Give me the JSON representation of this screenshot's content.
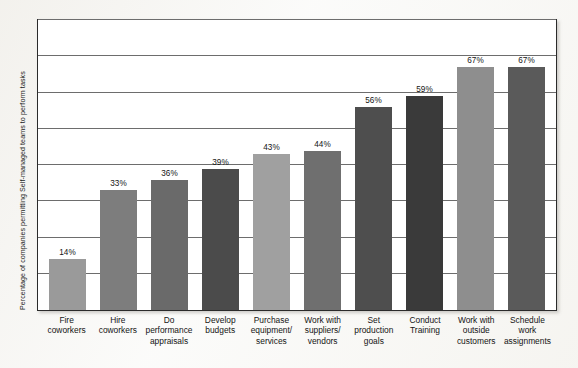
{
  "chart_data": {
    "type": "bar",
    "title": "",
    "xlabel": "",
    "ylabel": "Percentage of companies permitting Self-managed teams to perform tasks",
    "ylim": [
      0,
      80
    ],
    "grid": true,
    "gridline_values": [
      10,
      20,
      30,
      40,
      50,
      60,
      70,
      80
    ],
    "legend": "none",
    "value_label_suffix": "%",
    "categories": [
      "Fire coworkers",
      "Hire coworkers",
      "Do performance appraisals",
      "Develop budgets",
      "Purchase equipment/ services",
      "Work with suppliers/ vendors",
      "Set production goals",
      "Conduct Training",
      "Work with outside customers",
      "Schedule work assignments"
    ],
    "category_lines": [
      [
        "Fire",
        "coworkers"
      ],
      [
        "Hire",
        "coworkers"
      ],
      [
        "Do",
        "performance",
        "appraisals"
      ],
      [
        "Develop",
        "budgets"
      ],
      [
        "Purchase",
        "equipment/",
        "services"
      ],
      [
        "Work with",
        "suppliers/",
        "vendors"
      ],
      [
        "Set",
        "production",
        "goals"
      ],
      [
        "Conduct",
        "Training"
      ],
      [
        "Work with",
        "outside",
        "customers"
      ],
      [
        "Schedule",
        "work",
        "assignments"
      ]
    ],
    "values": [
      14,
      33,
      36,
      39,
      43,
      44,
      56,
      59,
      67,
      67
    ],
    "value_labels": [
      "14%",
      "33%",
      "36%",
      "39%",
      "43%",
      "44%",
      "56%",
      "59%",
      "67%",
      "67%"
    ],
    "bar_colors": [
      "#9a9a9a",
      "#7d7d7d",
      "#6a6a6a",
      "#4b4b4b",
      "#a0a0a0",
      "#6f6f6f",
      "#4e4e4e",
      "#3a3a3a",
      "#8e8e8e",
      "#5a5a5a"
    ]
  },
  "colors": {
    "axis": "#2b2b2b",
    "gridline": "#6d6d6d",
    "text": "#141414",
    "plot_background": "#ffffff",
    "page_background": "#fbfbfa"
  }
}
